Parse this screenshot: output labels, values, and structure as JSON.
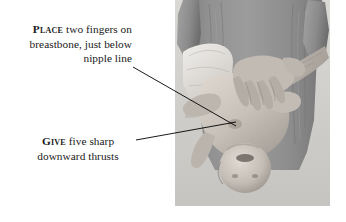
{
  "figure": {
    "width": 346,
    "height": 222,
    "background_color": "#ffffff",
    "text_color": "#1a1a1a",
    "line_color": "#000000"
  },
  "captions": {
    "place": {
      "lead_word": "Place",
      "lines": [
        "two fingers on",
        "breastbone, just below",
        "nipple line"
      ],
      "full_text": "PLACE two fingers on breastbone, just below nipple line",
      "align": "right"
    },
    "give": {
      "lead_word": "Give",
      "lines": [
        "five sharp",
        "downward thrusts"
      ],
      "full_text": "GIVE five sharp downward thrusts",
      "align": "center"
    }
  },
  "leader_lines": [
    {
      "name": "place-leader-line",
      "from_x": 133,
      "from_y": 67,
      "to_x": 236,
      "to_y": 126
    },
    {
      "name": "give-leader-line",
      "from_x": 136,
      "from_y": 140,
      "to_x": 236,
      "to_y": 122
    }
  ],
  "photo": {
    "description": "Grayscale photograph of an adult in a gray t-shirt holding an infant face-down along the forearm while delivering chest thrusts",
    "subjects": [
      "adult rescuer",
      "infant"
    ],
    "colors": {
      "shirt": "#8e8e8e",
      "shirt_shadow": "#6f6f6f",
      "shirt_highlight": "#a6a6a6",
      "skin": "#c9c3bc",
      "skin_shadow": "#9d968e",
      "skin_highlight": "#ded8d1",
      "towel": "#e8e6e2",
      "backdrop": "#d2d0cd",
      "hair": "#c8c2ba"
    }
  }
}
